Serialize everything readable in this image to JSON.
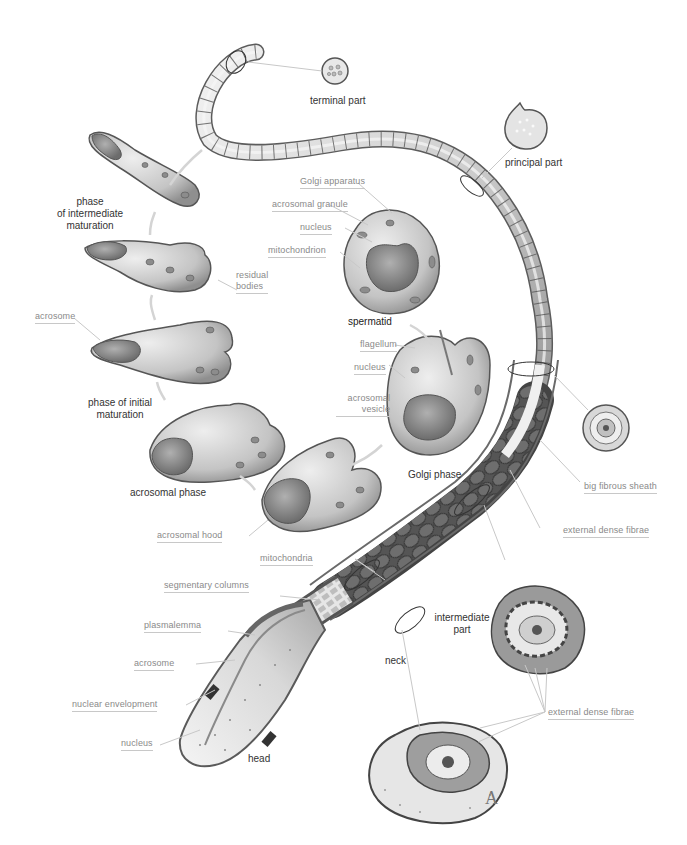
{
  "figure": {
    "panel_letter": "A",
    "colors": {
      "background": "#ffffff",
      "label_text": "#8a8a8a",
      "title_text": "#333333",
      "leader_line": "#c8c8c8",
      "cell_fill": "#cfcfcf",
      "cell_stroke": "#555555",
      "nucleus_fill": "#8d8d8d",
      "tail_fill": "#d9d9d9",
      "mitochondria_fill": "#4a4a4a"
    }
  },
  "stage_titles": {
    "terminal_part": "terminal part",
    "principal_part": "principal part",
    "phase_intermediate": [
      "phase",
      "of intermediate",
      "maturation"
    ],
    "spermatid": "spermatid",
    "phase_initial": [
      "phase of initial",
      "maturation"
    ],
    "golgi_phase": "Golgi phase",
    "acrosomal_phase": "acrosomal phase",
    "intermediate_part": [
      "intermediate",
      "part"
    ],
    "neck": "neck",
    "head": "head"
  },
  "labels": {
    "golgi_apparatus": "Golgi apparatus",
    "acrosomal_granule": "acrosomal granule",
    "nucleus_spermatid": "nucleus",
    "mitochondrion": "mitochondrion",
    "residual_bodies": [
      "residual",
      "bodies"
    ],
    "acrosome_initial": "acrosome",
    "flagellum": "flagellum",
    "nucleus_golgi": "nucleus",
    "acrosomal_vesicle": [
      "acrosomal",
      "vesicle"
    ],
    "big_fibrous_sheath": "big fibrous sheath",
    "external_dense_fibrae_1": "external dense fibrae",
    "acrosomal_hood": "acrosomal hood",
    "mitochondria": "mitochondria",
    "segmentary_columns": "segmentary columns",
    "plasmalemma": "plasmalemma",
    "acrosome_head": "acrosome",
    "nuclear_envelopment": "nuclear envelopment",
    "nucleus_head": "nucleus",
    "external_dense_fibrae_2": "external dense fibrae"
  }
}
